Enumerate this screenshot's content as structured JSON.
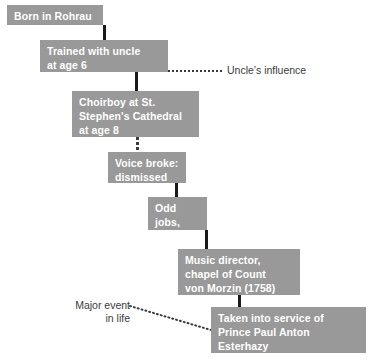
{
  "diagram": {
    "box_fill_color": "#999999",
    "box_text_color": "#ffffff",
    "annotation_text_color": "#3b3b3b",
    "connector_color": "#1a1a1a",
    "background_color": "#ffffff",
    "nodes": [
      {
        "id": "born",
        "label": "Born in Rohrau"
      },
      {
        "id": "trained",
        "label": "Trained with uncle\nat age 6"
      },
      {
        "id": "choirboy",
        "label": "Choirboy at St.\nStephen's Cathedral\nat age 8"
      },
      {
        "id": "voice-broke",
        "label": "Voice broke:\ndismissed"
      },
      {
        "id": "odd-jobs",
        "label": "Odd jobs,\nteaching"
      },
      {
        "id": "music-director",
        "label": "Music director,\nchapel of Count\nvon Morzin (1758)"
      },
      {
        "id": "esterhazy",
        "label": "Taken into service of\nPrince Paul Anton Esterhazy\n(1761–next 30 yrs.)"
      }
    ],
    "annotations": [
      {
        "id": "uncles-influence",
        "label": "Uncle’s influence"
      },
      {
        "id": "major-event",
        "label": "Major event\nin life"
      }
    ]
  }
}
